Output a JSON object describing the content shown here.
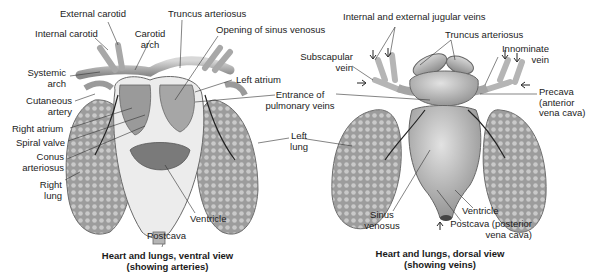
{
  "ventral": {
    "caption_line1": "Heart and lungs, ventral view",
    "caption_line2": "(showing arteries)",
    "labels": {
      "external_carotid": "External carotid",
      "internal_carotid": "Internal carotid",
      "carotid_arch_1": "Carotid",
      "carotid_arch_2": "arch",
      "truncus_arteriosus": "Truncus arteriosus",
      "opening_sinus_venosus": "Opening of sinus venosus",
      "systemic_arch_1": "Systemic",
      "systemic_arch_2": "arch",
      "left_atrium": "Left atrium",
      "cutaneous_artery_1": "Cutaneous",
      "cutaneous_artery_2": "artery",
      "entrance_pulmonary_1": "Entrance of",
      "entrance_pulmonary_2": "pulmonary veins",
      "right_atrium": "Right atrium",
      "spiral_valve": "Spiral valve",
      "conus_arteriosus_1": "Conus",
      "conus_arteriosus_2": "arteriosus",
      "left_lung_1": "Left",
      "left_lung_2": "lung",
      "right_lung_1": "Right",
      "right_lung_2": "lung",
      "ventricle": "Ventricle",
      "postcava": "Postcava"
    }
  },
  "dorsal": {
    "caption_line1": "Heart and lungs, dorsal view",
    "caption_line2": "(showing veins)",
    "labels": {
      "jugular_veins": "Internal and external jugular veins",
      "truncus_arteriosus": "Truncus arteriosus",
      "subscapular_vein_1": "Subscapular",
      "subscapular_vein_2": "vein",
      "innominate_vein_1": "Innominate",
      "innominate_vein_2": "vein",
      "precava_1": "Precava",
      "precava_2": "(anterior",
      "precava_3": "vena cava)",
      "sinus_venosus_1": "Sinus",
      "sinus_venosus_2": "venosus",
      "ventricle": "Ventricle",
      "postcava_1": "Postcava (posterior",
      "postcava_2": "vena cava)"
    }
  },
  "colors": {
    "lung_fill": "#a9a9a9",
    "heart_fill": "#c4c4c4",
    "vessel_fill": "#b8b8b8",
    "ventricle_inner": "#e6e6e6",
    "leader_line": "#333333"
  }
}
